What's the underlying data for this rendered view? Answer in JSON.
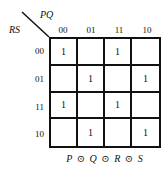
{
  "kmap": {
    "col_var": "PQ",
    "row_var": "RS",
    "col_labels": [
      "00",
      "01",
      "11",
      "10"
    ],
    "row_labels": [
      "00",
      "01",
      "11",
      "10"
    ],
    "cells": [
      [
        "1",
        "",
        "1",
        ""
      ],
      [
        "",
        "1",
        "",
        "1"
      ],
      [
        "1",
        "",
        "1",
        ""
      ],
      [
        "",
        "1",
        "",
        "1"
      ]
    ],
    "caption": "P ⊙ Q ⊙ R ⊙ S"
  }
}
